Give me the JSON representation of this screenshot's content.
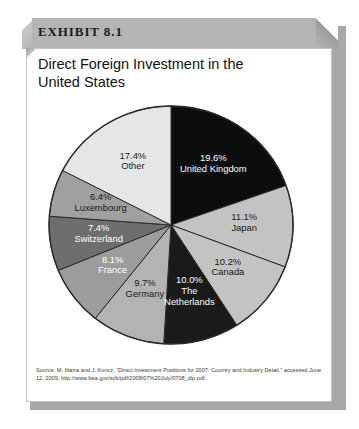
{
  "exhibit": {
    "label": "EXHIBIT 8.1",
    "title": "Direct Foreign Investment in the United States"
  },
  "source": {
    "prefix": "Source: M. Ibarra and J. Koncz, “Direct Investment Positions for 2007: Country and Industry Detail,” accessed June 12, 2009, ",
    "url": "http://www.bea.gov/scb/pdf/2008/07%20July/0708_dip.pdf."
  },
  "colors": {
    "band": "#b4b4b4",
    "shadow": "#a8a8a8",
    "card": "#ffffff",
    "outline": "#2b2b2b"
  },
  "chart_data": {
    "type": "pie",
    "title": "Direct Foreign Investment in the United States",
    "subtitle": "",
    "xlabel": "",
    "ylabel": "",
    "legend_position": "none",
    "value_unit": "percent",
    "start_angle_deg": 0,
    "direction": "clockwise",
    "labels": [
      "United Kingdom",
      "Japan",
      "Canada",
      "The Netherlands",
      "Germany",
      "France",
      "Switzerland",
      "Luxembourg",
      "Other"
    ],
    "values": [
      19.6,
      11.1,
      10.2,
      10.0,
      9.7,
      8.1,
      7.4,
      6.4,
      17.4
    ],
    "value_labels": [
      "19.6%",
      "11.1%",
      "10.2%",
      "10.0%",
      "9.7%",
      "8.1%",
      "7.4%",
      "6.4%",
      "17.4%"
    ],
    "slice_colors": [
      "#0d0d0d",
      "#c3c3c3",
      "#c3c3c3",
      "#1a1a1a",
      "#b3b3b3",
      "#9c9c9c",
      "#6e6e6e",
      "#a0a0a0",
      "#e6e6e6"
    ],
    "label_text_colors": [
      "light",
      "dark",
      "dark",
      "light",
      "dark",
      "light",
      "light",
      "dark",
      "dark"
    ],
    "total": 99.9
  }
}
